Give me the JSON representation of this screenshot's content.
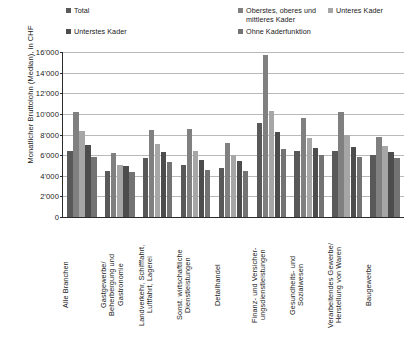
{
  "legend": {
    "items": [
      {
        "label": "Total",
        "color": "#595959",
        "name": "legend-item-total"
      },
      {
        "label": "Oberstes, oberes und\nmittleres Kader",
        "color": "#808080",
        "name": "legend-item-oberstes-kader"
      },
      {
        "label": "Unteres Kader",
        "color": "#a6a6a6",
        "name": "legend-item-unteres-kader"
      },
      {
        "label": "Unterstes Kader",
        "color": "#4d4d4d",
        "name": "legend-item-unterstes-kader"
      },
      {
        "label": "Ohne Kaderfunktion",
        "color": "#737373",
        "name": "legend-item-ohne-kaderfunktion"
      }
    ]
  },
  "axis": {
    "y_title": "Monatlicher Bruttolohn (Median), in CHF",
    "y_ticks": [
      "16'000",
      "14'000",
      "12'000",
      "10'000",
      "8'000",
      "6'000",
      "4'000",
      "2'000",
      "0"
    ]
  },
  "footnote": "",
  "chart_data": {
    "type": "bar",
    "title": "",
    "xlabel": "",
    "ylabel": "Monatlicher Bruttolohn (Median), in CHF",
    "ylim": [
      0,
      16000
    ],
    "ytick_values": [
      0,
      2000,
      4000,
      6000,
      8000,
      10000,
      12000,
      14000,
      16000
    ],
    "grid": true,
    "legend_position": "top",
    "categories": [
      "Alle Branchen",
      "Gastgewerbe/\nBeherbergung und\nGastronomie",
      "Landverkehr, Schifffahrt,\nLuftfahrt, Lagerei",
      "Sonst. wirtschaftliche\nDienstleistungen",
      "Detailhandel",
      "Finanz- und Versicher-\nungsdienstleistungen",
      "Gesundheits- und\nSozialwesen",
      "Verarbeitendes Gewerbe/\nHerstellung von Waren",
      "Baugewerbe"
    ],
    "series": [
      {
        "name": "Total",
        "color": "#595959",
        "values": [
          6400,
          4500,
          5700,
          5000,
          4800,
          9100,
          6400,
          6400,
          6000
        ]
      },
      {
        "name": "Oberstes, oberes und mittleres Kader",
        "color": "#808080",
        "values": [
          10200,
          6200,
          8400,
          8500,
          7200,
          15700,
          9600,
          10200,
          7800
        ]
      },
      {
        "name": "Unteres Kader",
        "color": "#a6a6a6",
        "values": [
          8300,
          5000,
          7100,
          6400,
          6000,
          10300,
          7700,
          8000,
          6900
        ]
      },
      {
        "name": "Unterstes Kader",
        "color": "#4d4d4d",
        "values": [
          7000,
          4900,
          6300,
          5500,
          5400,
          8200,
          6700,
          6800,
          6300
        ]
      },
      {
        "name": "Ohne Kaderfunktion",
        "color": "#737373",
        "values": [
          5800,
          4400,
          5300,
          4600,
          4500,
          6600,
          6000,
          5800,
          5700
        ]
      }
    ]
  }
}
